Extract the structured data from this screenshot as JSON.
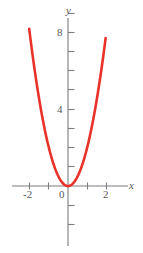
{
  "figure": {
    "background_color": "#ffffff",
    "axis_color": "#7d7d80",
    "label_color": "#58585a",
    "curve_color": "#e8322a"
  },
  "chart_data": {
    "type": "line",
    "title": "",
    "subtitle": "",
    "xlabel": "x",
    "ylabel": "y",
    "xlim": [
      -2.9,
      3.3
    ],
    "ylim": [
      -3.1,
      9.5
    ],
    "grid": false,
    "legend": null,
    "annotations": [],
    "x_ticks": [
      -2,
      -1,
      0,
      1,
      2,
      3
    ],
    "x_tick_labels": [
      "-2",
      "",
      "0",
      "",
      "2",
      ""
    ],
    "y_ticks": [
      -3,
      -2,
      -1,
      1,
      2,
      3,
      4,
      5,
      6,
      7,
      8,
      9
    ],
    "y_tick_labels": [
      "",
      "",
      "",
      "",
      "",
      "",
      "4",
      "",
      "",
      "",
      "8",
      ""
    ],
    "origin_label": "0",
    "series": [
      {
        "name": "parabola",
        "equation": "y = 2x^2",
        "color": "#e8322a",
        "x": [
          -2.02,
          -1.8,
          -1.6,
          -1.4,
          -1.2,
          -1.0,
          -0.8,
          -0.6,
          -0.4,
          -0.2,
          0.0,
          0.2,
          0.4,
          0.6,
          0.8,
          1.0,
          1.2,
          1.4,
          1.6,
          1.8,
          1.96
        ],
        "values": [
          8.16,
          6.48,
          5.12,
          3.92,
          2.88,
          2.0,
          1.28,
          0.72,
          0.32,
          0.08,
          0.0,
          0.08,
          0.32,
          0.72,
          1.28,
          2.0,
          2.88,
          3.92,
          5.12,
          6.48,
          7.68
        ]
      }
    ]
  },
  "labels": {
    "y_axis_name": "y",
    "x_axis_name": "x",
    "tick_8": "8",
    "tick_4": "4",
    "tick_0": "0",
    "tick_neg2": "-2",
    "tick_pos2": "2"
  }
}
